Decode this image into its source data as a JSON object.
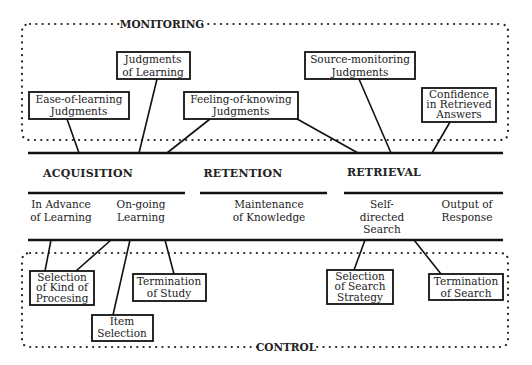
{
  "diagram": {
    "monitoring": {
      "label": "MONITORING",
      "boxes": [
        {
          "id": "eol",
          "lines": [
            "Ease-of-learning",
            "Judgments"
          ]
        },
        {
          "id": "jol",
          "lines": [
            "Judgments",
            "of Learning"
          ]
        },
        {
          "id": "fok",
          "lines": [
            "Feeling-of-knowing",
            "Judgments"
          ]
        },
        {
          "id": "smj",
          "lines": [
            "Source-monitoring",
            "Judgments"
          ]
        },
        {
          "id": "conf",
          "lines": [
            "Confidence",
            "in Retrieved",
            "Answers"
          ]
        }
      ]
    },
    "phases": [
      {
        "label": "ACQUISITION",
        "subs": [
          [
            "In Advance",
            "of Learning"
          ],
          [
            "On-going",
            "Learning"
          ]
        ]
      },
      {
        "label": "RETENTION",
        "subs": [
          [
            "Maintenance",
            "of Knowledge"
          ]
        ]
      },
      {
        "label": "RETRIEVAL",
        "subs": [
          [
            "Self-",
            "directed",
            "Search"
          ],
          [
            "Output of",
            "Response"
          ]
        ]
      }
    ],
    "control": {
      "label": "CONTROL",
      "boxes": [
        {
          "id": "skp",
          "lines": [
            "Selection",
            "of Kind of",
            "Procesing"
          ]
        },
        {
          "id": "item",
          "lines": [
            "Item",
            "Selection"
          ]
        },
        {
          "id": "tos",
          "lines": [
            "Termination",
            "of Study"
          ]
        },
        {
          "id": "sss",
          "lines": [
            "Selection",
            "of Search",
            "Strategy"
          ]
        },
        {
          "id": "tosr",
          "lines": [
            "Termination",
            "of Search"
          ]
        }
      ]
    }
  }
}
